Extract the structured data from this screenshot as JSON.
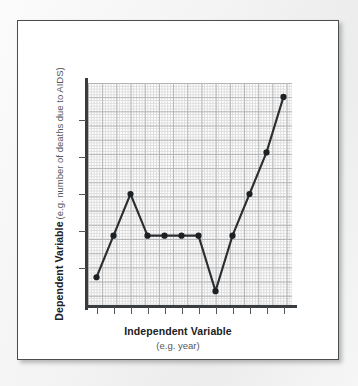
{
  "figure": {
    "background_color": "#f2f2f2",
    "card_color": "#ffffff",
    "border_color": "#4a4d50"
  },
  "chart_data": {
    "type": "line",
    "title": "",
    "subtitle": "",
    "xlabel": "Independent Variable",
    "xlabel_sub": "(e.g. year)",
    "ylabel": "Dependent Variable",
    "ylabel_sub": "(e.g. number of deaths due to AIDS)",
    "x": [
      1,
      2,
      3,
      4,
      5,
      6,
      7,
      8,
      9,
      10,
      11,
      12
    ],
    "values": [
      2,
      5,
      8,
      5,
      5,
      5,
      5,
      1,
      5,
      8,
      11,
      15
    ],
    "xtick_labels": [
      "",
      "",
      "",
      "",
      "",
      "",
      "",
      "",
      "",
      "",
      "",
      ""
    ],
    "ytick_labels": [
      "",
      "",
      "",
      "",
      ""
    ],
    "xlim": [
      0.5,
      12.5
    ],
    "ylim": [
      0,
      16
    ],
    "grid": true,
    "grid_minor": true,
    "legend": false,
    "legend_position": "none",
    "line_color": "#2b2e31",
    "marker_color": "#1d2022",
    "marker": "circle",
    "grid_color_minor": "#dcdcdc",
    "grid_color_major": "#b4b4b4",
    "annotations": []
  }
}
